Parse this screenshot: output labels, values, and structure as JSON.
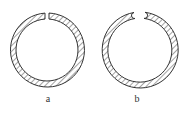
{
  "figure": {
    "labels": {
      "a": "a",
      "b": "b"
    },
    "rings": [
      {
        "id": "a",
        "description": "split ring with straight vertical cut",
        "center": [
          47,
          50
        ],
        "outer_radius": 37,
        "inner_radius": 31
      },
      {
        "id": "b",
        "description": "split ring with rounded angled ends",
        "center": [
          140,
          50
        ],
        "outer_radius": 38,
        "inner_radius": 32
      }
    ],
    "colors": {
      "stroke": "#333333",
      "hatch": "#555555",
      "background": "#ffffff"
    }
  }
}
